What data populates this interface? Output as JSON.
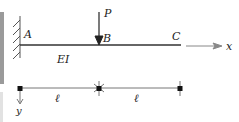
{
  "diagram": {
    "type": "cantilever-beam",
    "labels": {
      "support": "A",
      "load_point": "B",
      "free_end": "C",
      "load": "P",
      "stiffness": "EI",
      "x_axis": "x",
      "y_axis": "y",
      "segment_1": "ℓ",
      "segment_2": "ℓ"
    },
    "colors": {
      "beam": "#333333",
      "axis": "#888888",
      "dimension": "#666666"
    }
  }
}
